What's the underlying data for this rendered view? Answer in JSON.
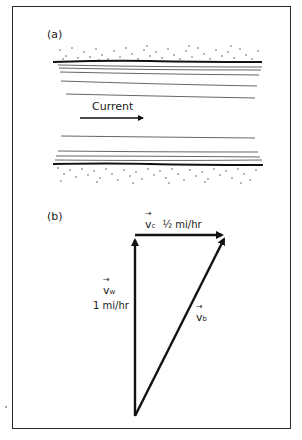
{
  "figure": {
    "part_a": {
      "label": "(a)",
      "flow_label": "Current"
    },
    "part_b": {
      "label": "(b)",
      "vectors": {
        "current": {
          "symbol": "v",
          "subscript": "c",
          "magnitude": "½ mi/hr"
        },
        "water": {
          "symbol": "v",
          "subscript": "w",
          "magnitude": "1 mi/hr"
        },
        "boat": {
          "symbol": "v",
          "subscript": "b"
        }
      }
    }
  }
}
